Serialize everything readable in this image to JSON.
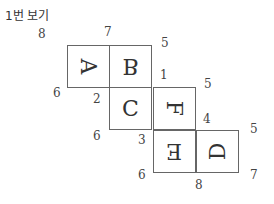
{
  "title": "1번 보기",
  "faces": [
    {
      "letter": "A",
      "transform": "rotate(90deg)"
    },
    {
      "letter": "B",
      "transform": "rotate(180deg) scaleX(-1)"
    },
    {
      "letter": "C",
      "transform": "none"
    },
    {
      "letter": "F",
      "transform": "rotate(90deg)"
    },
    {
      "letter": "E",
      "transform": "rotate(180deg)"
    },
    {
      "letter": "D",
      "transform": "rotate(-90deg)"
    }
  ],
  "vertex_labels": [
    "8",
    "7",
    "5",
    "1",
    "5",
    "6",
    "2",
    "4",
    "5",
    "6",
    "3",
    "6",
    "8",
    "7"
  ]
}
